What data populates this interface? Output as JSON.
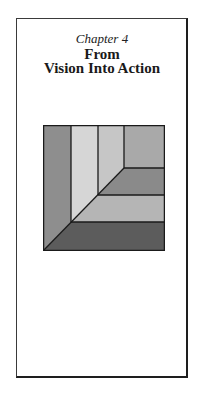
{
  "chapter_label": "Chapter 4",
  "title_lines": [
    "From",
    "Vision Into Action"
  ],
  "figure": {
    "colors": {
      "left_column": "#8e8e8e",
      "second_column": "#d6d6d6",
      "third_column": "#c6c6c6",
      "top_right": "#a9a9a9",
      "band_upper": "#8a8a8a",
      "band_lower": "#b5b5b5",
      "bottom_band": "#5c5c5c",
      "line": "#1a1a1a"
    }
  }
}
